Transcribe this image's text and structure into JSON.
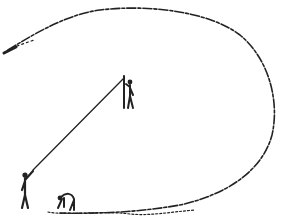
{
  "illustration": {
    "description": "Line drawing of a thrown object's looping trajectory with three figures",
    "colors": {
      "ink": "#222222",
      "background": "#ffffff"
    },
    "elements": [
      {
        "name": "trajectory-loop",
        "kind": "dashed-curve"
      },
      {
        "name": "thrown-object",
        "kind": "object",
        "position": [
          12,
          50
        ]
      },
      {
        "name": "figure-standing-left",
        "kind": "stick-figure",
        "position": [
          25,
          195
        ]
      },
      {
        "name": "figure-holding-pole",
        "kind": "stick-figure",
        "position": [
          128,
          92
        ]
      },
      {
        "name": "figure-crouching",
        "kind": "stick-figure",
        "position": [
          63,
          205
        ]
      },
      {
        "name": "sight-line",
        "kind": "line",
        "from": [
          35,
          168
        ],
        "to": [
          124,
          78
        ]
      },
      {
        "name": "ground-scribble",
        "kind": "ground",
        "from": [
          50,
          212
        ],
        "to": [
          200,
          214
        ]
      }
    ]
  }
}
